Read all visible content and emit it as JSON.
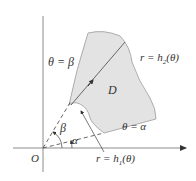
{
  "diagram": {
    "colors": {
      "region_fill": "#e3e3e3",
      "region_stroke": "#9a9a9a",
      "axis": "#8c8c8c",
      "text": "#333333"
    },
    "labels": {
      "theta_beta": "θ = β",
      "r_h2": "r = h",
      "r_h2_sub": "2",
      "r_h2_arg": "(θ)",
      "region": "D",
      "beta": "β",
      "alpha": "α",
      "theta_alpha": "θ = α",
      "origin": "O",
      "r_h1": "r = h",
      "r_h1_sub": "1",
      "r_h1_arg": "(θ)"
    }
  }
}
